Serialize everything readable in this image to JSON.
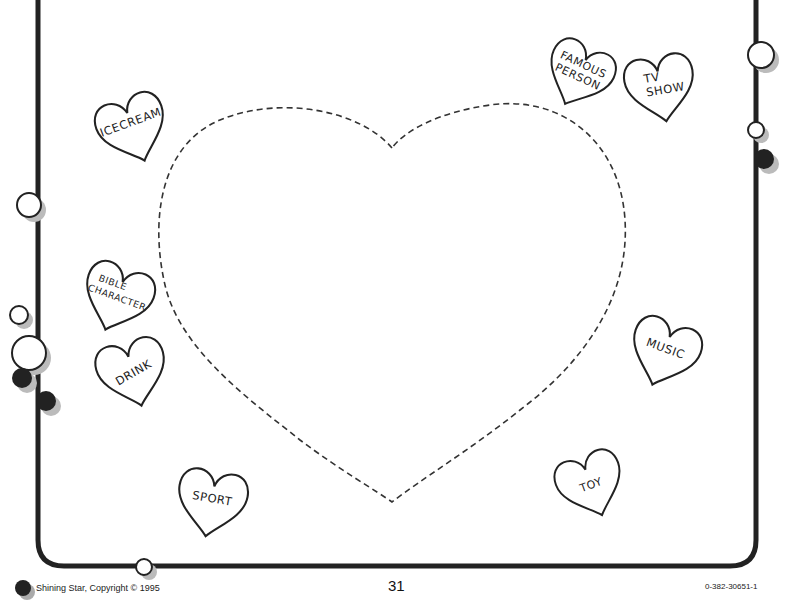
{
  "page": {
    "number": "31",
    "publisher": "Shining Star, Copyright © 1995",
    "isbn": "0-382-30651-1"
  },
  "hearts": [
    {
      "label_lines": [
        "ICECREAM"
      ]
    },
    {
      "label_lines": [
        "FAMOUS",
        "PERSON"
      ]
    },
    {
      "label_lines": [
        "TV",
        "SHOW"
      ]
    },
    {
      "label_lines": [
        "BIBLE",
        "CHARACTER"
      ]
    },
    {
      "label_lines": [
        "DRINK"
      ]
    },
    {
      "label_lines": [
        "MUSIC"
      ]
    },
    {
      "label_lines": [
        "SPORT"
      ]
    },
    {
      "label_lines": [
        "TOY"
      ]
    }
  ],
  "colors": {
    "ink": "#222222",
    "shadow": "#b0b0b0",
    "paper": "#ffffff"
  }
}
